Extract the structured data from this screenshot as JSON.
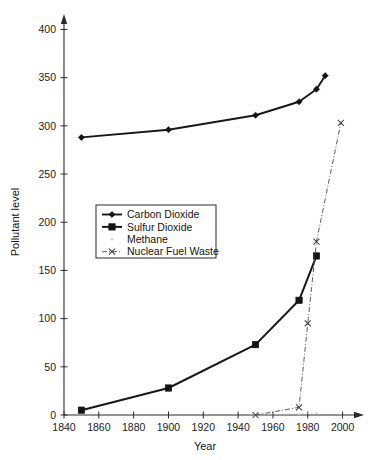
{
  "chart_data": {
    "type": "line",
    "title": "",
    "xlabel": "Year",
    "ylabel": "Pollutant level",
    "xlim": [
      1840,
      2010
    ],
    "ylim": [
      0,
      415
    ],
    "xticks": [
      1840,
      1860,
      1880,
      1900,
      1920,
      1940,
      1960,
      1980,
      2000
    ],
    "yticks": [
      0,
      50,
      100,
      150,
      200,
      250,
      300,
      350,
      400
    ],
    "xtick_labels": [
      "1840",
      "1860",
      "1880",
      "1900",
      "1920",
      "1940",
      "1960",
      "1980",
      "2000"
    ],
    "ytick_labels": [
      "0",
      "50",
      "100",
      "150",
      "200",
      "250",
      "300",
      "350",
      "400"
    ],
    "grid": false,
    "axis_arrows": true,
    "legend_position": "center-left-inside",
    "series": [
      {
        "name": "Carbon Dioxide",
        "marker": "filled-diamond",
        "line_style": "solid",
        "color": "#171717",
        "x": [
          1850,
          1900,
          1950,
          1975,
          1985,
          1990
        ],
        "values": [
          288,
          296,
          311,
          325,
          338,
          352
        ]
      },
      {
        "name": "Sulfur Dioxide",
        "marker": "filled-square",
        "line_style": "solid",
        "color": "#171717",
        "x": [
          1850,
          1900,
          1950,
          1975,
          1985
        ],
        "values": [
          5,
          28,
          73,
          119,
          165
        ]
      },
      {
        "name": "Methane",
        "marker": "faint-dot",
        "line_style": "dotted",
        "color": "#cbcbcb",
        "x": [
          1950,
          1975,
          1985
        ],
        "values": [
          0,
          1,
          2
        ]
      },
      {
        "name": "Nuclear Fuel Waste",
        "marker": "x-cross",
        "line_style": "dash-dot",
        "color": "#4a4a4a",
        "x": [
          1950,
          1975,
          1980,
          1985,
          1999
        ],
        "values": [
          0,
          8,
          95,
          180,
          303
        ]
      }
    ]
  },
  "legend": {
    "entries": [
      {
        "label": "Carbon Dioxide"
      },
      {
        "label": "Sulfur Dioxide"
      },
      {
        "label": "Methane"
      },
      {
        "label": "Nuclear Fuel Waste"
      }
    ]
  },
  "colors": {
    "axis": "#2b2b2b",
    "text": "#141414",
    "series_primary": "#171717",
    "series_faint": "#cbcbcb",
    "series_nuclear": "#4a4a4a",
    "background": "#ffffff"
  }
}
